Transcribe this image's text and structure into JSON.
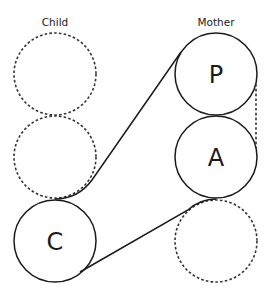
{
  "columns": {
    "child": {
      "label": "Child"
    },
    "mother": {
      "label": "Mother"
    }
  },
  "nodes": {
    "child_top": {
      "label": "",
      "style": "dashed"
    },
    "child_middle": {
      "label": "",
      "style": "dashed"
    },
    "child_c": {
      "label": "C",
      "style": "solid"
    },
    "mother_p": {
      "label": "P",
      "style": "solid"
    },
    "mother_a": {
      "label": "A",
      "style": "solid"
    },
    "mother_bottom": {
      "label": "",
      "style": "dashed"
    }
  },
  "connections": [
    {
      "from": "child_middle",
      "to": "mother_p",
      "style": "solid"
    },
    {
      "from": "child_c",
      "to": "mother_a",
      "style": "solid"
    },
    {
      "from": "mother_p",
      "to": "mother_a",
      "style": "dashed"
    }
  ],
  "colors": {
    "stroke": "#1a1a1a",
    "dashed_stroke": "#333333",
    "background": "#ffffff"
  }
}
